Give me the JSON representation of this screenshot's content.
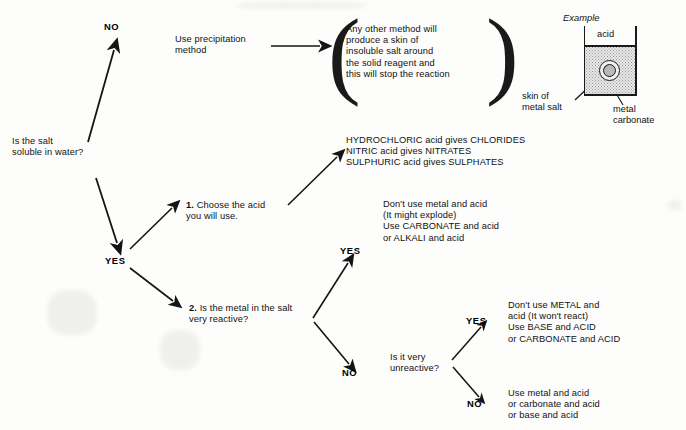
{
  "diagram": {
    "root_question": "Is the salt\nsoluble in water?",
    "labels": {
      "no_top": "NO",
      "yes_main": "YES",
      "yes_reactive": "YES",
      "no_reactive": "NO",
      "yes_unreactive": "YES",
      "no_unreactive": "NO"
    },
    "precipitation": {
      "instruction": "Use precipitation\nmethod",
      "note": "Any other method will\nproduce a skin of\ninsoluble salt around\nthe solid reagent and\nthis will stop the reaction"
    },
    "step1": {
      "number": "1.",
      "text": " Choose the acid\nyou will use."
    },
    "acid_table": "HYDROCHLORIC acid gives CHLORIDES\nNITRIC acid gives NITRATES\nSULPHURIC acid gives SULPHATES",
    "step2": {
      "number": "2.",
      "text": " Is the metal in the salt\nvery reactive?"
    },
    "reactive_yes_advice": "Don't use metal and acid\n(It might explode)\nUse CARBONATE and acid\nor ALKALI and acid",
    "unreactive_question": "Is it very\nunreactive?",
    "unreactive_yes_advice": "Don't use METAL and\nacid (It won't react)\nUse BASE and ACID\nor CARBONATE and ACID",
    "unreactive_no_advice": "Use metal and acid\nor carbonate and acid\nor base and acid",
    "example": {
      "caption": "Example",
      "acid_label": "acid",
      "skin_label": "skin of\nmetal salt",
      "carbonate_label": "metal\ncarbonate"
    },
    "colors": {
      "ink": "#111111",
      "paper": "#fdfdfc",
      "liquid_fill": "#e9e9e9",
      "blob_fill": "#b9b9b9"
    }
  }
}
